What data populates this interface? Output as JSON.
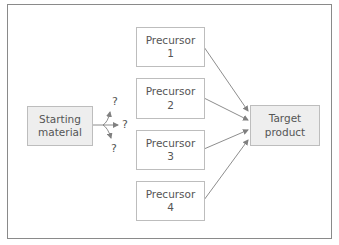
{
  "diagram": {
    "starting_material": {
      "line1": "Starting",
      "line2": "material"
    },
    "precursors": [
      {
        "line1": "Precursor",
        "line2": "1"
      },
      {
        "line1": "Precursor",
        "line2": "2"
      },
      {
        "line1": "Precursor",
        "line2": "3"
      },
      {
        "line1": "Precursor",
        "line2": "4"
      }
    ],
    "target": {
      "line1": "Target",
      "line2": "product"
    },
    "unknown_marks": [
      "?",
      "?",
      "?"
    ],
    "colors": {
      "box_fill_shaded": "#eeeeee",
      "box_border": "#bdbdbd",
      "arrow": "#808080",
      "frame": "#8a8a8a",
      "text": "#555555"
    }
  }
}
